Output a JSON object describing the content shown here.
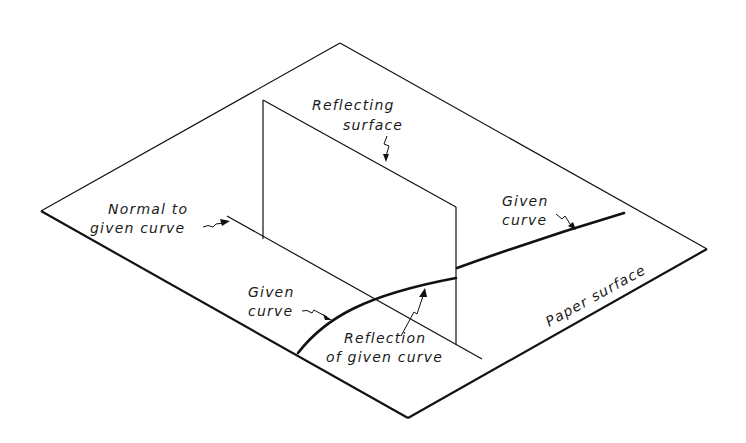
{
  "figure": {
    "type": "isometric-diagram"
  },
  "labels": {
    "reflecting_surface": {
      "line1": "Reflecting",
      "line2": "surface"
    },
    "normal": {
      "line1": "Normal to",
      "line2": "given curve"
    },
    "given_curve_right": {
      "line1": "Given",
      "line2": "curve"
    },
    "given_curve_left": {
      "line1": "Given",
      "line2": "curve"
    },
    "reflection": {
      "line1": "Reflection",
      "line2": "of given curve"
    },
    "paper_surface": "Paper surface"
  },
  "colors": {
    "background": "#ffffff",
    "ink": "#111111"
  }
}
